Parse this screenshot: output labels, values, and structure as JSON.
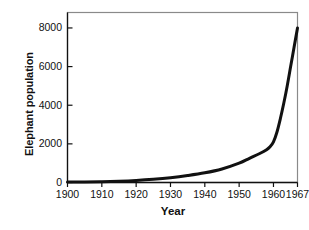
{
  "chart_data": {
    "type": "line",
    "title": "",
    "xlabel": "Year",
    "ylabel": "Elephant population",
    "xlim": [
      1900,
      1967
    ],
    "ylim": [
      0,
      8800
    ],
    "grid": false,
    "legend": false,
    "xticks": [
      1900,
      1910,
      1920,
      1930,
      1940,
      1950,
      1960,
      1967
    ],
    "xtick_labels": [
      "1900",
      "1910",
      "1920",
      "1930",
      "1940",
      "1950",
      "1960",
      "1967"
    ],
    "yticks": [
      0,
      2000,
      4000,
      6000,
      8000
    ],
    "ytick_labels": [
      "0",
      "2000",
      "4000",
      "6000",
      "8000"
    ],
    "series": [
      {
        "name": "Elephant population",
        "color": "#111111",
        "linewidth": 3,
        "x": [
          1900,
          1905,
          1910,
          1915,
          1920,
          1925,
          1930,
          1935,
          1940,
          1945,
          1950,
          1953,
          1956,
          1958,
          1959,
          1960,
          1961,
          1962,
          1963,
          1964,
          1965,
          1966,
          1967
        ],
        "y": [
          20,
          30,
          45,
          70,
          110,
          170,
          250,
          360,
          500,
          700,
          1000,
          1250,
          1500,
          1700,
          1850,
          2100,
          2600,
          3300,
          4100,
          5000,
          6000,
          7000,
          8000
        ]
      }
    ]
  },
  "axes": {
    "frame_color": "#8a8a8a",
    "axis_color": "#111111"
  }
}
